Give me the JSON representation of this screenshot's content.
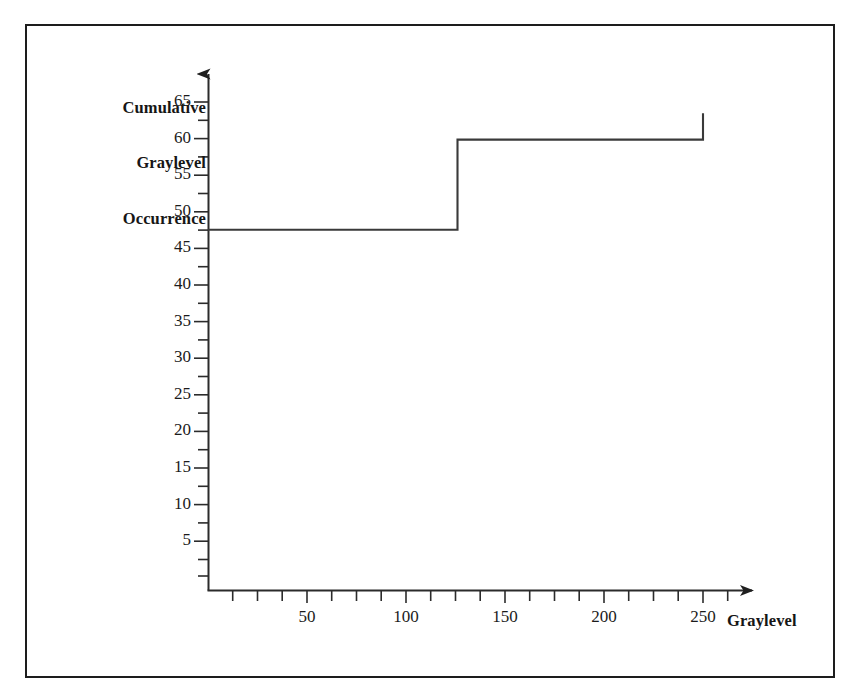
{
  "figure": {
    "border_color": "#1d1d1d",
    "background": "#ffffff",
    "line_color": "#3a3a3a",
    "axis_color": "#2b2b2b"
  },
  "labels": {
    "y_axis_title_line1": "Cumulative",
    "y_axis_title_line2": "Graylevel",
    "y_axis_title_line3": "Occurrence",
    "x_axis_title": "Graylevel"
  },
  "ticks": {
    "y": [
      "65",
      "60",
      "55",
      "50",
      "45",
      "40",
      "35",
      "30",
      "25",
      "20",
      "15",
      "10",
      "5"
    ],
    "x": [
      "50",
      "100",
      "150",
      "200",
      "250"
    ]
  },
  "caption_ghost": "",
  "chart_data": {
    "type": "line",
    "subtype": "step",
    "title": "",
    "xlabel": "Graylevel",
    "ylabel": "Cumulative Graylevel Occurrence",
    "xlim": [
      0,
      280
    ],
    "ylim": [
      0,
      68
    ],
    "xticks": [
      50,
      100,
      150,
      200,
      250
    ],
    "yticks": [
      5,
      10,
      15,
      20,
      25,
      30,
      35,
      40,
      45,
      50,
      55,
      60,
      65
    ],
    "x_minor_tick_step": 12.5,
    "y_minor_tick_step": 2.5,
    "grid": false,
    "legend": null,
    "axis_arrows": true,
    "series": [
      {
        "name": "Cumulative graylevel occurrence",
        "x": [
          0,
          126,
          126,
          250,
          250
        ],
        "y": [
          48,
          48,
          60,
          60,
          63.5
        ],
        "step_points": [
          {
            "graylevel": 0,
            "cumulative": 48
          },
          {
            "graylevel": 126,
            "cumulative": 48
          },
          {
            "graylevel": 126,
            "cumulative": 60
          },
          {
            "graylevel": 250,
            "cumulative": 60
          },
          {
            "graylevel": 250,
            "cumulative": 63.5
          }
        ]
      }
    ]
  }
}
